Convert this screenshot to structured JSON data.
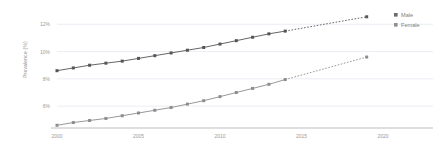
{
  "chart_data": {
    "type": "line",
    "title": "",
    "xlabel": "",
    "ylabel": "Prevalence (%)",
    "xlim": [
      2000,
      2020
    ],
    "ylim": [
      4.4,
      12.9
    ],
    "xticks": [
      2000,
      2005,
      2010,
      2015,
      2020
    ],
    "xtick_labels": [
      "2000",
      "2005",
      "2010",
      "2015",
      "2020"
    ],
    "yticks": [
      6,
      8,
      10,
      12
    ],
    "ytick_labels": [
      "6%",
      "8%",
      "10%",
      "12%"
    ],
    "grid": "horizontal",
    "legend_position": "right",
    "x": [
      2000,
      2001,
      2002,
      2003,
      2004,
      2005,
      2006,
      2007,
      2008,
      2009,
      2010,
      2011,
      2012,
      2013,
      2014,
      2019
    ],
    "observed_through": 2014,
    "projected_from": 2014,
    "projected_to": 2019,
    "series": [
      {
        "name": "Male",
        "color": "#555555",
        "values": [
          8.6,
          8.8,
          9.0,
          9.15,
          9.3,
          9.5,
          9.7,
          9.9,
          10.1,
          10.3,
          10.55,
          10.8,
          11.05,
          11.3,
          11.5,
          12.55
        ]
      },
      {
        "name": "Female",
        "color": "#8d8d8d",
        "values": [
          4.6,
          4.8,
          4.95,
          5.1,
          5.3,
          5.5,
          5.7,
          5.9,
          6.15,
          6.4,
          6.7,
          7.0,
          7.3,
          7.6,
          7.95,
          9.6
        ]
      }
    ]
  },
  "legend": {
    "items": [
      {
        "label": "Male",
        "marker_color": "#6b6b6b"
      },
      {
        "label": "Female",
        "marker_color": "#8f8f8f"
      }
    ]
  },
  "colors": {
    "grid": "#e4e9ef",
    "axis": "#b8b8b8",
    "tick_text": "#9a9a9a",
    "axis_title": "#8a8a8a",
    "background": "#ffffff"
  }
}
